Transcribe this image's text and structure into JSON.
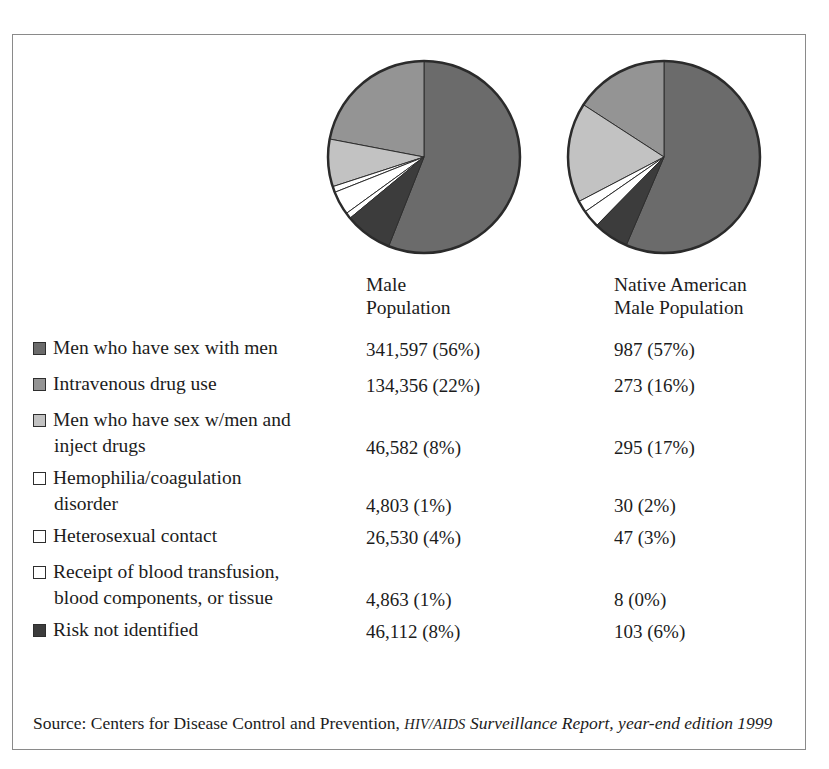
{
  "figure": {
    "columns": [
      {
        "id": "male",
        "header_line1": "Male",
        "header_line2": "Population"
      },
      {
        "id": "native_american_male",
        "header_line1": "Native American",
        "header_line2": "Male Population"
      }
    ],
    "source": {
      "prefix": "Source: Centers for Disease Control and Prevention, ",
      "publication_smallcaps": "HIV/AIDS",
      "publication_italic": " Surveillance Report, year-end edition 1999"
    }
  },
  "chart_data": {
    "type": "pie",
    "title": "",
    "categories": [
      "Men who have sex with men",
      "Intravenous drug use",
      "Men who have sex w/men and inject drugs",
      "Hemophilia/coagulation disorder",
      "Heterosexual contact",
      "Receipt of blood transfusion, blood components, or tissue",
      "Risk not identified"
    ],
    "colors": [
      "#6b6b6b",
      "#949494",
      "#c2c2c2",
      "#ffffff",
      "#ffffff",
      "#ffffff",
      "#3c3c3c"
    ],
    "legend_position": "left",
    "series": [
      {
        "name": "Male Population",
        "values": [
          56,
          22,
          8,
          1,
          4,
          1,
          8
        ],
        "counts": [
          341597,
          134356,
          46582,
          4803,
          26530,
          4863,
          46112
        ]
      },
      {
        "name": "Native American Male Population",
        "values": [
          57,
          16,
          17,
          2,
          3,
          0,
          6
        ],
        "counts": [
          987,
          273,
          295,
          30,
          47,
          8,
          103
        ]
      }
    ]
  },
  "rows": [
    {
      "label_line1": "Men who have sex with men",
      "label_line2": "",
      "swatch": "#6b6b6b",
      "male": "341,597 (56%)",
      "native": "987 (57%)"
    },
    {
      "label_line1": "Intravenous drug use",
      "label_line2": "",
      "swatch": "#949494",
      "male": "134,356 (22%)",
      "native": "273 (16%)"
    },
    {
      "label_line1": "Men who have sex w/men and",
      "label_line2": "inject drugs",
      "swatch": "#c2c2c2",
      "male": "46,582 (8%)",
      "native": "295 (17%)"
    },
    {
      "label_line1": "Hemophilia/coagulation",
      "label_line2": "disorder",
      "swatch": "#ffffff",
      "male": "4,803 (1%)",
      "native": "30 (2%)"
    },
    {
      "label_line1": "Heterosexual contact",
      "label_line2": "",
      "swatch": "#ffffff",
      "male": "26,530 (4%)",
      "native": "47 (3%)"
    },
    {
      "label_line1": "Receipt of blood transfusion,",
      "label_line2": "blood components, or tissue",
      "swatch": "#ffffff",
      "male": "4,863 (1%)",
      "native": "8 (0%)"
    },
    {
      "label_line1": "Risk not identified",
      "label_line2": "",
      "swatch": "#3c3c3c",
      "male": "46,112 (8%)",
      "native": "103 (6%)"
    }
  ]
}
